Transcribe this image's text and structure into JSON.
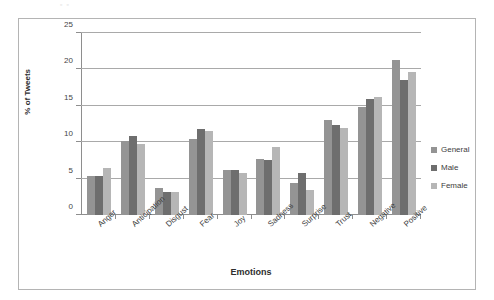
{
  "page": {
    "scan_artifact_text": "▫ ▫"
  },
  "chart_data": {
    "type": "bar",
    "title": "",
    "xlabel": "Emotions",
    "ylabel": "% of Tweets",
    "ylim": [
      0,
      25
    ],
    "ytick_values": [
      0,
      5,
      10,
      15,
      20,
      25
    ],
    "ytick_labels": [
      "0",
      "5",
      "10",
      "15",
      "20",
      "25"
    ],
    "grid": true,
    "legend_position": "right",
    "categories": [
      "Anger",
      "Anticipation",
      "Disgust",
      "Fear",
      "Joy",
      "Sadness",
      "Surprise",
      "Trust",
      "Negative",
      "Positive"
    ],
    "series": [
      {
        "name": "General",
        "color": "#949494",
        "values": [
          5.4,
          10.1,
          3.7,
          10.5,
          6.2,
          7.7,
          4.4,
          13.0,
          14.8,
          21.3
        ]
      },
      {
        "name": "Male",
        "color": "#6e6e6e",
        "values": [
          5.3,
          10.8,
          3.1,
          11.8,
          6.2,
          7.5,
          5.8,
          12.3,
          16.0,
          18.5
        ]
      },
      {
        "name": "Female",
        "color": "#b6b6b6",
        "values": [
          6.5,
          9.7,
          3.2,
          11.6,
          5.8,
          9.3,
          3.5,
          12.0,
          16.2,
          19.6
        ]
      }
    ]
  }
}
